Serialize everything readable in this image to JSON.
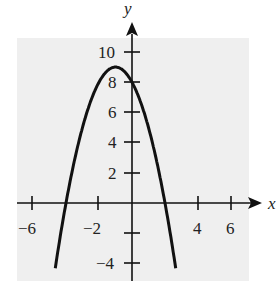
{
  "chart_data": {
    "type": "line",
    "title": "",
    "xlabel": "x",
    "ylabel": "y",
    "xlim": [
      -7,
      7.5
    ],
    "ylim": [
      -5,
      11.5
    ],
    "x_ticks": [
      -6,
      -2,
      4,
      6
    ],
    "y_ticks": [
      10,
      8,
      6,
      4,
      2,
      -4
    ],
    "x_tick_marks": [
      -6,
      -4,
      -2,
      0,
      2,
      4,
      6
    ],
    "y_tick_marks": [
      -4,
      -2,
      2,
      4,
      6,
      8,
      10
    ],
    "grid": false,
    "background": "#efefef",
    "series": [
      {
        "name": "y = -x^2 - 2x + 8",
        "equation": "y = -x^2 - 2x + 8",
        "roots": [
          -4,
          2
        ],
        "vertex": [
          -1,
          9
        ],
        "y_intercept": 8,
        "x": [
          -4.6,
          -4,
          -3,
          -2,
          -1,
          0,
          1,
          2,
          2.6
        ],
        "values": [
          -4.36,
          0,
          5,
          8,
          9,
          8,
          5,
          0,
          -4.36
        ]
      }
    ]
  },
  "labels": {
    "x_axis": "x",
    "y_axis": "y",
    "xt": [
      "−6",
      "−2",
      "4",
      "6"
    ],
    "yt": [
      "10",
      "8",
      "6",
      "4",
      "2",
      "−4"
    ]
  }
}
